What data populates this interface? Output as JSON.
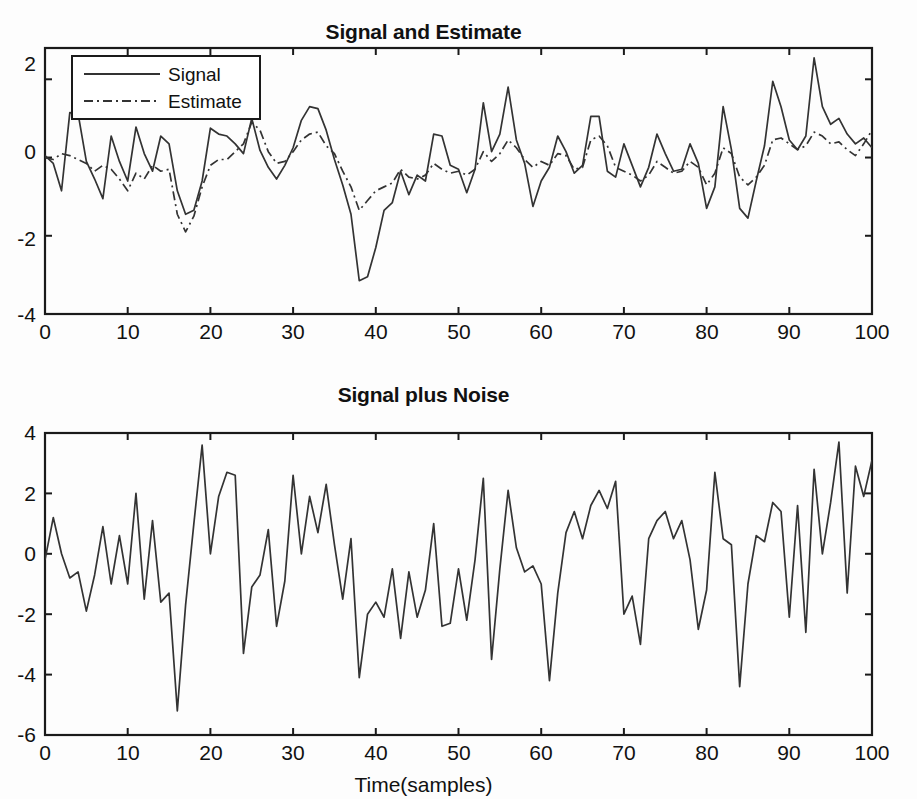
{
  "figure": {
    "background": "#fdfdfd",
    "line_color": "#333333",
    "axis_color": "#1a1a1a"
  },
  "chart_data": [
    {
      "type": "line",
      "title": "Signal and Estimate",
      "xlabel": "",
      "ylabel": "",
      "xlim": [
        0,
        100
      ],
      "ylim": [
        -4,
        2.8
      ],
      "xticks": [
        0,
        10,
        20,
        30,
        40,
        50,
        60,
        70,
        80,
        90,
        100
      ],
      "yticks": [
        2,
        0,
        -2,
        -4
      ],
      "xticklabels": [
        "0",
        "10",
        "20",
        "30",
        "40",
        "50",
        "60",
        "70",
        "80",
        "90",
        "100"
      ],
      "yticklabels": [
        "2",
        "0",
        "-2",
        "-4"
      ],
      "grid": false,
      "legend": {
        "position": "upper-left",
        "entries": [
          {
            "label": "Signal",
            "style": "solid"
          },
          {
            "label": "Estimate",
            "style": "dash-dot"
          }
        ]
      },
      "series": [
        {
          "name": "Signal",
          "style": "solid",
          "values": [
            0.05,
            -0.15,
            -0.85,
            1.15,
            1.12,
            -0.1,
            -0.55,
            -1.05,
            0.55,
            -0.1,
            -0.6,
            0.78,
            0.1,
            -0.35,
            0.55,
            0.35,
            -0.85,
            -1.45,
            -1.35,
            -0.6,
            0.75,
            0.6,
            0.55,
            0.35,
            0.1,
            1.0,
            0.18,
            -0.25,
            -0.55,
            -0.2,
            0.25,
            0.95,
            1.3,
            1.25,
            0.7,
            -0.05,
            -0.7,
            -1.45,
            -3.15,
            -3.05,
            -2.3,
            -1.35,
            -1.15,
            -0.35,
            -0.95,
            -0.45,
            -0.6,
            0.6,
            0.55,
            -0.2,
            -0.3,
            -0.9,
            -0.3,
            1.4,
            0.15,
            0.6,
            1.8,
            0.45,
            -0.15,
            -1.25,
            -0.6,
            -0.25,
            0.55,
            0.15,
            -0.4,
            -0.2,
            1.05,
            1.05,
            -0.35,
            -0.5,
            0.35,
            -0.2,
            -0.75,
            -0.25,
            0.6,
            0.1,
            -0.35,
            -0.3,
            0.35,
            -0.15,
            -1.3,
            -0.75,
            1.3,
            0.2,
            -1.3,
            -1.55,
            -0.6,
            0.3,
            1.95,
            1.3,
            0.45,
            0.2,
            0.55,
            2.55,
            1.3,
            0.85,
            1.0,
            0.6,
            0.35,
            0.5,
            0.25
          ]
        },
        {
          "name": "Estimate",
          "style": "dash-dot",
          "values": [
            0.0,
            -0.05,
            0.1,
            0.05,
            -0.05,
            -0.15,
            -0.35,
            -0.2,
            -0.3,
            -0.55,
            -0.85,
            -0.4,
            -0.55,
            -0.2,
            -0.35,
            -0.3,
            -1.45,
            -1.9,
            -1.5,
            -0.75,
            -0.2,
            -0.05,
            -0.05,
            0.15,
            0.35,
            0.9,
            0.7,
            0.15,
            -0.15,
            -0.1,
            0.15,
            0.45,
            0.6,
            0.65,
            0.3,
            0.1,
            -0.35,
            -0.75,
            -1.35,
            -1.1,
            -0.85,
            -0.75,
            -0.65,
            -0.3,
            -0.5,
            -0.55,
            -0.45,
            -0.15,
            -0.3,
            -0.4,
            -0.35,
            -0.45,
            -0.3,
            0.15,
            -0.1,
            0.1,
            0.45,
            0.25,
            -0.05,
            -0.25,
            -0.1,
            -0.2,
            0.1,
            0.05,
            -0.3,
            -0.25,
            0.45,
            0.55,
            0.3,
            -0.25,
            -0.35,
            -0.45,
            -0.6,
            -0.45,
            -0.1,
            -0.25,
            -0.4,
            -0.35,
            -0.1,
            -0.25,
            -0.7,
            -0.4,
            0.25,
            0.1,
            -0.5,
            -0.7,
            -0.5,
            -0.2,
            0.45,
            0.5,
            0.35,
            0.2,
            0.3,
            0.65,
            0.55,
            0.35,
            0.4,
            0.2,
            0.05,
            0.35,
            0.7
          ]
        }
      ]
    },
    {
      "type": "line",
      "title": "Signal plus Noise",
      "xlabel": "Time(samples)",
      "ylabel": "",
      "xlim": [
        0,
        100
      ],
      "ylim": [
        -6,
        4
      ],
      "xticks": [
        0,
        10,
        20,
        30,
        40,
        50,
        60,
        70,
        80,
        90,
        100
      ],
      "yticks": [
        4,
        2,
        0,
        -2,
        -4,
        -6
      ],
      "xticklabels": [
        "0",
        "10",
        "20",
        "30",
        "40",
        "50",
        "60",
        "70",
        "80",
        "90",
        "100"
      ],
      "yticklabels": [
        "4",
        "2",
        "0",
        "-2",
        "-4",
        "-6"
      ],
      "grid": false,
      "legend": null,
      "series": [
        {
          "name": "Signal plus Noise",
          "style": "solid",
          "values": [
            -0.2,
            1.2,
            0.0,
            -0.8,
            -0.6,
            -1.9,
            -0.7,
            0.9,
            -1.0,
            0.6,
            -1.0,
            2.0,
            -1.5,
            1.1,
            -1.6,
            -1.3,
            -5.2,
            -1.7,
            1.0,
            3.6,
            0.0,
            1.9,
            2.7,
            2.6,
            -3.3,
            -1.1,
            -0.7,
            0.8,
            -2.4,
            -0.9,
            2.6,
            0.0,
            1.9,
            0.7,
            2.3,
            0.3,
            -1.5,
            0.5,
            -4.1,
            -2.0,
            -1.6,
            -2.1,
            -0.5,
            -2.8,
            -0.6,
            -2.1,
            -1.2,
            1.0,
            -2.4,
            -2.3,
            -0.5,
            -2.2,
            -0.2,
            2.5,
            -3.5,
            -0.5,
            2.1,
            0.2,
            -0.6,
            -0.4,
            -1.0,
            -4.2,
            -1.3,
            0.7,
            1.4,
            0.5,
            1.6,
            2.1,
            1.5,
            2.4,
            -2.0,
            -1.4,
            -3.0,
            0.5,
            1.1,
            1.4,
            0.5,
            1.1,
            -0.2,
            -2.5,
            -1.2,
            2.7,
            0.5,
            0.3,
            -4.4,
            -1.0,
            0.6,
            0.4,
            1.7,
            1.4,
            -2.1,
            1.6,
            -2.6,
            2.8,
            0.0,
            1.7,
            3.7,
            -1.3,
            2.9,
            1.9,
            3.1
          ]
        }
      ]
    }
  ]
}
